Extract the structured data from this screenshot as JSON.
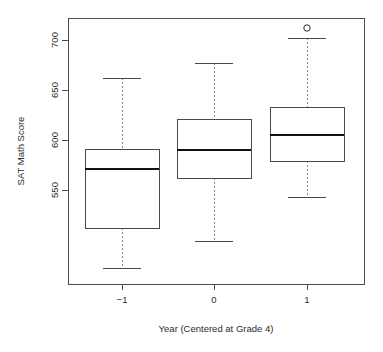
{
  "chart_data": {
    "type": "boxplot",
    "title": "",
    "xlabel": "Year (Centered at Grade 4)",
    "ylabel": "SAT Math Score",
    "categories": [
      "-1",
      "0",
      "1"
    ],
    "x_tick_labels": [
      "−1",
      "0",
      "1"
    ],
    "y_tick_labels": [
      "550",
      "600",
      "650",
      "700"
    ],
    "y_tick_values": [
      550,
      600,
      650,
      700
    ],
    "ylim": [
      465,
      720
    ],
    "xlim": [
      0.5,
      3.5
    ],
    "grid": false,
    "legend": false,
    "boxes": [
      {
        "category": "-1",
        "whisker_low": 472,
        "q1": 512,
        "median": 571,
        "q3": 591,
        "whisker_high": 662,
        "outliers": []
      },
      {
        "category": "0",
        "whisker_low": 499,
        "q1": 562,
        "median": 590,
        "q3": 621,
        "whisker_high": 677,
        "outliers": []
      },
      {
        "category": "1",
        "whisker_low": 543,
        "q1": 579,
        "median": 605,
        "q3": 633,
        "whisker_high": 702,
        "outliers": [
          712
        ]
      }
    ]
  },
  "colors": {
    "background": "#ffffff",
    "frame": "#4d4d4d",
    "box_border": "#4a4a4a",
    "median": "#111111",
    "whisker": "#8a8a8a",
    "text": "#2b2b2b"
  }
}
